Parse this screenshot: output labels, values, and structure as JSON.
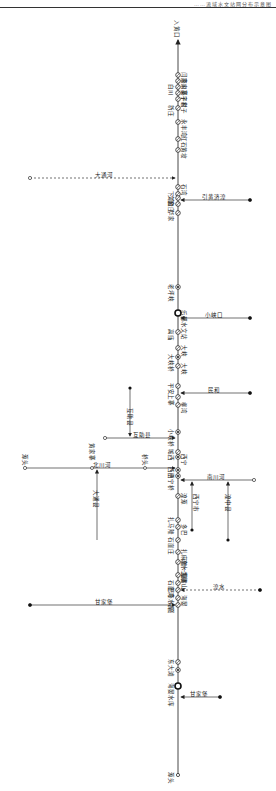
{
  "header": {
    "text": "……流域水文站网分布示意图"
  },
  "main_river": {
    "top_label": "入黄口",
    "bottom_label": "源头",
    "x": 178,
    "y_top": 40,
    "y_bottom": 775
  },
  "stations": [
    {
      "y": 75,
      "label": "闫家川",
      "side": "right",
      "type": "open"
    },
    {
      "y": 81,
      "label": "燕家寨",
      "side": "right",
      "type": "open"
    },
    {
      "y": 87,
      "label": "白川",
      "side": "left",
      "type": "open"
    },
    {
      "y": 93,
      "label": "吴子村",
      "side": "right",
      "type": "open"
    },
    {
      "y": 99,
      "label": "宇家子",
      "side": "right",
      "type": "open"
    },
    {
      "y": 108,
      "label": "新庄",
      "side": "left",
      "type": "open"
    },
    {
      "y": 122,
      "label": "永丰湾",
      "side": "right",
      "type": "open"
    },
    {
      "y": 139,
      "label": "红石",
      "side": "right",
      "type": "open"
    },
    {
      "y": 150,
      "label": "黄坡",
      "side": "right",
      "type": "open"
    },
    {
      "y": 187,
      "label": "石湾",
      "side": "right",
      "type": "open"
    },
    {
      "y": 194,
      "label": "下湾",
      "side": "left",
      "type": "open"
    },
    {
      "y": 198,
      "label": "文和",
      "side": "left",
      "type": "open"
    },
    {
      "y": 204,
      "label": "金庄",
      "side": "left",
      "type": "open"
    },
    {
      "y": 213,
      "label": "华家",
      "side": "left",
      "type": "open"
    },
    {
      "y": 287,
      "label": "老坪峡",
      "side": "left",
      "type": "dot"
    },
    {
      "y": 313,
      "label": "乐都水文站",
      "side": "right",
      "type": "main"
    },
    {
      "y": 332,
      "label": "高庙",
      "side": "left",
      "type": "open"
    },
    {
      "y": 348,
      "label": "大峡",
      "side": "right",
      "type": "open"
    },
    {
      "y": 357,
      "label": "大峡桥",
      "side": "left",
      "type": "dot"
    },
    {
      "y": 366,
      "label": "大峡",
      "side": "right",
      "type": "open"
    },
    {
      "y": 386,
      "label": "平安",
      "side": "left",
      "type": "open"
    },
    {
      "y": 397,
      "label": "上寨",
      "side": "left",
      "type": "open"
    },
    {
      "y": 405,
      "label": "柳湾",
      "side": "right",
      "type": "open"
    },
    {
      "y": 432,
      "label": "小峡桥",
      "side": "left",
      "type": "dot"
    },
    {
      "y": 452,
      "label": "城西",
      "side": "left",
      "type": "open"
    },
    {
      "y": 457,
      "label": "西宁",
      "side": "right",
      "type": "dot"
    },
    {
      "y": 470,
      "label": "西宁",
      "side": "left",
      "type": "dot"
    },
    {
      "y": 476,
      "label": "西宁桥",
      "side": "left",
      "type": "dot"
    },
    {
      "y": 496,
      "label": "湟源",
      "side": "right",
      "type": "open"
    },
    {
      "y": 520,
      "label": "扎马隆",
      "side": "left",
      "type": "open"
    },
    {
      "y": 527,
      "label": "多巴",
      "side": "right",
      "type": "open"
    },
    {
      "y": 540,
      "label": "石崖庄",
      "side": "left",
      "type": "open"
    },
    {
      "y": 552,
      "label": "扎麻隆一级",
      "side": "right",
      "type": "open"
    },
    {
      "y": 562,
      "label": "湟水二级",
      "side": "right",
      "type": "open"
    },
    {
      "y": 575,
      "label": "黑嘴山",
      "side": "right",
      "type": "open"
    },
    {
      "y": 583,
      "label": "石崖湾",
      "side": "left",
      "type": "open"
    },
    {
      "y": 590,
      "label": "巴燕水库",
      "side": "left",
      "type": "open"
    },
    {
      "y": 598,
      "label": "海晏",
      "side": "right",
      "type": "open"
    },
    {
      "y": 605,
      "label": "克图",
      "side": "left",
      "type": "open"
    },
    {
      "y": 662,
      "label": "东大滩",
      "side": "left",
      "type": "open"
    },
    {
      "y": 670,
      "label": "",
      "side": "left",
      "type": "dot"
    },
    {
      "y": 686,
      "label": "海晏水库",
      "side": "left",
      "type": "main"
    },
    {
      "y": 775,
      "label": "源头",
      "side": "left",
      "type": "source"
    }
  ],
  "tributaries": [
    {
      "name": "大通河",
      "from_x": 30,
      "y": 178,
      "dashed": true,
      "side": "left"
    },
    {
      "name": "引黄济湟",
      "from_x": 250,
      "y": 200,
      "dashed": false,
      "side": "right",
      "label2": "引黄济湟"
    },
    {
      "name": "小峡口",
      "from_x": 250,
      "y": 318,
      "dashed": false,
      "side": "right"
    },
    {
      "name": "民和",
      "from_x": 250,
      "y": 393,
      "dashed": false,
      "side": "right"
    },
    {
      "name": "互助县",
      "from_x": 105,
      "y": 438,
      "dashed": false,
      "side": "left",
      "vertical_label": "互助县",
      "branch_y_top": 388
    },
    {
      "name": "北川河",
      "from_x": 25,
      "y": 468,
      "dashed": false,
      "side": "left",
      "source_label": "源头",
      "mid_label": "黄家寨",
      "mid_x": 92,
      "near_label": "桥头",
      "near_x": 145,
      "branch_label": "大通县",
      "branch_y_bottom": 540
    },
    {
      "name": "南川河",
      "from_x": 254,
      "y": 480,
      "dashed": false,
      "side": "right",
      "branch_label": "湟中县",
      "branch_x": 228,
      "branch_y_bottom": 540,
      "inner_label": "西宁市",
      "inner_x": 192
    },
    {
      "name": "甘家堡",
      "from_x": 30,
      "y": 605,
      "dashed": false,
      "side": "left"
    },
    {
      "name": "甘家堡",
      "from_x": 220,
      "y": 697,
      "dashed": false,
      "side": "right"
    },
    {
      "name": "湟水",
      "from_x": 260,
      "y": 590,
      "dashed": true,
      "side": "right"
    }
  ]
}
